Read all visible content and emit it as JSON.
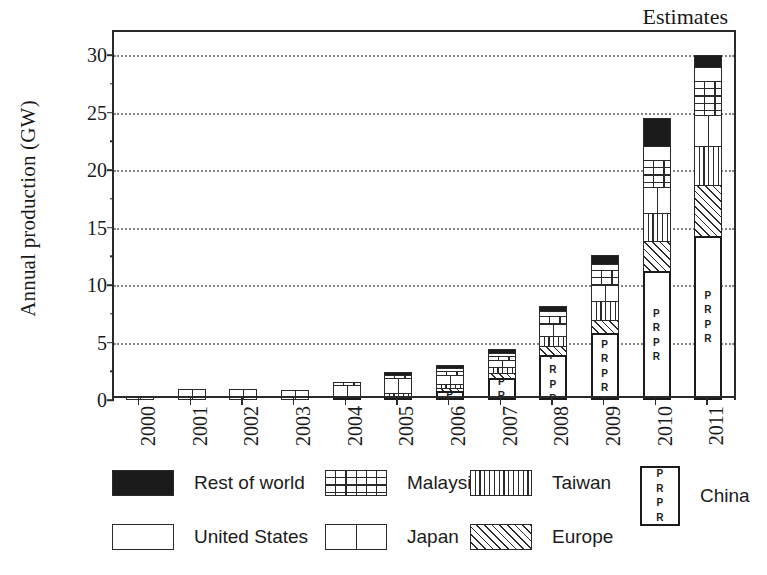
{
  "chart_data": {
    "type": "bar",
    "subtype": "stacked-bar",
    "title": "",
    "xlabel": "",
    "ylabel": "Annual production (GW)",
    "ylim": [
      0,
      32
    ],
    "yticks": [
      0,
      5,
      10,
      15,
      20,
      25,
      30
    ],
    "grid": "horizontal-dotted",
    "legend_position": "bottom",
    "annotations": [
      {
        "text": "Estimates",
        "x": "2010-2011",
        "position": "top-right"
      }
    ],
    "categories": [
      "2000",
      "2001",
      "2002",
      "2003",
      "2004",
      "2005",
      "2006",
      "2007",
      "2008",
      "2009",
      "2010",
      "2011"
    ],
    "series": [
      {
        "name": "China",
        "pattern": "china-pr-box",
        "values": [
          0.0,
          0.0,
          0.0,
          0.0,
          0.15,
          0.3,
          0.8,
          1.9,
          3.9,
          5.8,
          11.2,
          14.3
        ]
      },
      {
        "name": "Europe",
        "pattern": "diagonal-hatch",
        "values": [
          0.0,
          0.0,
          0.0,
          0.0,
          0.0,
          0.0,
          0.25,
          0.45,
          0.8,
          1.2,
          2.6,
          4.4
        ]
      },
      {
        "name": "Taiwan",
        "pattern": "vertical-stripe",
        "values": [
          0.0,
          0.0,
          0.0,
          0.0,
          0.0,
          0.1,
          0.3,
          0.5,
          0.9,
          1.6,
          2.5,
          3.4
        ]
      },
      {
        "name": "Japan",
        "pattern": "single-divider",
        "values": [
          0.28,
          0.95,
          0.95,
          0.9,
          0.95,
          1.3,
          0.85,
          0.65,
          1.0,
          1.4,
          2.2,
          2.7
        ]
      },
      {
        "name": "Malaysia",
        "pattern": "grid",
        "values": [
          0.0,
          0.0,
          0.0,
          0.0,
          0.15,
          0.25,
          0.3,
          0.35,
          0.7,
          1.3,
          2.4,
          2.9
        ]
      },
      {
        "name": "United States",
        "pattern": "plain-white",
        "values": [
          0.0,
          0.0,
          0.0,
          0.0,
          0.0,
          0.0,
          0.15,
          0.25,
          0.4,
          0.55,
          1.2,
          1.3
        ]
      },
      {
        "name": "Rest of world",
        "pattern": "solid-black",
        "values": [
          0.0,
          0.0,
          0.0,
          0.0,
          0.0,
          0.05,
          0.2,
          0.35,
          0.5,
          0.75,
          2.4,
          1.0
        ]
      }
    ],
    "totals": [
      0.28,
      0.95,
      0.95,
      0.9,
      1.25,
      2.0,
      2.85,
      4.45,
      8.2,
      12.6,
      24.5,
      30.0
    ]
  },
  "axis": {
    "ylabel": "Annual production (GW)",
    "ytick_labels": [
      "0",
      "5",
      "10",
      "15",
      "20",
      "25",
      "30"
    ],
    "xtick_labels": [
      "2000",
      "2001",
      "2002",
      "2003",
      "2004",
      "2005",
      "2006",
      "2007",
      "2008",
      "2009",
      "2010",
      "2011"
    ]
  },
  "annotation": {
    "estimates": "Estimates"
  },
  "china_marker": "P\nR\nP\nR",
  "legend": {
    "items": [
      {
        "label": "Rest of world",
        "pattern": "solid-black",
        "swatch_class": "p-rest",
        "col": 0,
        "row": 0
      },
      {
        "label": "United States",
        "pattern": "plain-white",
        "swatch_class": "p-us",
        "col": 0,
        "row": 1
      },
      {
        "label": "Malaysia",
        "pattern": "grid",
        "swatch_class": "p-malaysia",
        "col": 1,
        "row": 0
      },
      {
        "label": "Japan",
        "pattern": "single-divider",
        "swatch_class": "p-japan",
        "col": 1,
        "row": 1
      },
      {
        "label": "Taiwan",
        "pattern": "vertical-stripe",
        "swatch_class": "p-taiwan",
        "col": 2,
        "row": 0
      },
      {
        "label": "Europe",
        "pattern": "diagonal-hatch",
        "swatch_class": "p-europe",
        "col": 2,
        "row": 1
      },
      {
        "label": "China",
        "pattern": "china-pr-box",
        "swatch_class": "p-china",
        "col": 3,
        "row": 0
      }
    ]
  },
  "colors": {
    "ink": "#1b1b1b",
    "axis": "#2a2a2a",
    "grid": "#6e6e6e",
    "background": "#ffffff"
  }
}
